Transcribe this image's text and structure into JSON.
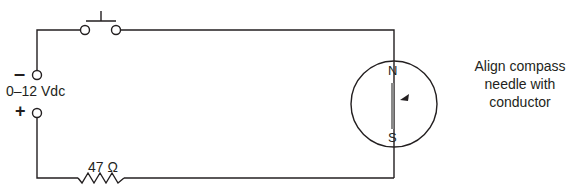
{
  "diagram": {
    "type": "circuit-schematic",
    "supply": {
      "label": "0–12 Vdc",
      "negative_symbol": "–",
      "positive_symbol": "+"
    },
    "resistor": {
      "label": "47 Ω"
    },
    "switch": {
      "type": "normally-open pushbutton"
    },
    "compass": {
      "north_label": "N",
      "south_label": "S"
    },
    "instruction": "Align compass needle with conductor",
    "colors": {
      "line": "#231f20",
      "needle": "#8a8a8a",
      "background": "#ffffff"
    }
  }
}
